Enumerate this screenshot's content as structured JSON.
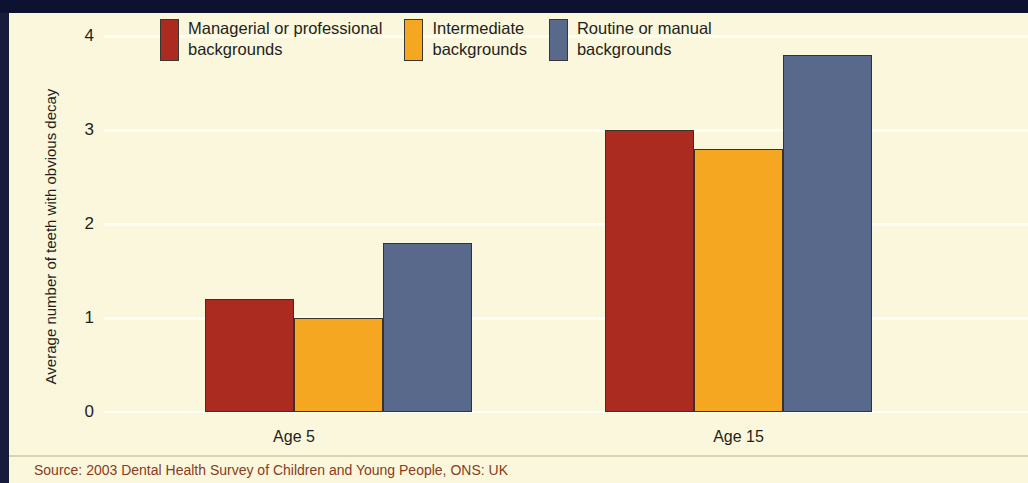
{
  "chart_data": {
    "type": "bar",
    "title": "",
    "subtitle": "",
    "xlabel": "",
    "ylabel": "Average number of teeth with obvious decay",
    "categories": [
      "Age 5",
      "Age 15"
    ],
    "series": [
      {
        "name": "Managerial or professional backgrounds",
        "color": "#ab2b21",
        "values": [
          1.2,
          3.0
        ]
      },
      {
        "name": "Intermediate backgrounds",
        "color": "#f6a722",
        "values": [
          1.0,
          2.8
        ]
      },
      {
        "name": "Routine or manual backgrounds",
        "color": "#58698b",
        "values": [
          1.8,
          3.8
        ]
      }
    ],
    "ylim": [
      0,
      4
    ],
    "yticks": [
      "0",
      "1",
      "2",
      "3",
      "4"
    ],
    "grid": true,
    "legend_position": "top",
    "source": "Source: 2003 Dental Health Survey of Children and Young People, ONS: UK"
  },
  "legend": {
    "items": [
      {
        "label": "Managerial or professional\nbackgrounds",
        "color": "#ab2b21"
      },
      {
        "label": "Intermediate\nbackgrounds",
        "color": "#f6a722"
      },
      {
        "label": "Routine or manual\nbackgrounds",
        "color": "#58698b"
      }
    ]
  },
  "axis": {
    "y_title": "Average number of teeth with obvious decay",
    "y_tick_4": "4",
    "y_tick_3": "3",
    "y_tick_2": "2",
    "y_tick_1": "1",
    "y_tick_0": "0",
    "x_cat_0": "Age 5",
    "x_cat_1": "Age 15"
  },
  "footer": {
    "source": "Source: 2003 Dental Health Survey of Children and Young People, ONS: UK"
  },
  "colors": {
    "background": "#faf7dd",
    "frame": "#0d1230",
    "gridline": "#fffef2",
    "source_text": "#8a3b22",
    "series_red": "#ab2b21",
    "series_orange": "#f6a722",
    "series_blue": "#58698b"
  }
}
